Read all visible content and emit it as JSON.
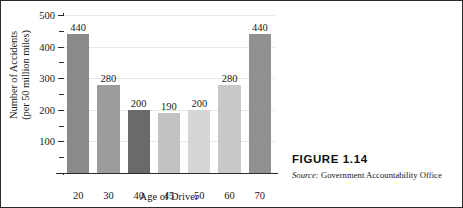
{
  "chart_data": {
    "type": "bar",
    "title": "",
    "xlabel": "Age of Driver",
    "ylabel": "Number of Accidents (per 50 million miles)",
    "ylabel_lines": [
      "Number of Accidents",
      "(per 50 million miles)"
    ],
    "categories": [
      "20",
      "30",
      "40",
      "45",
      "50",
      "60",
      "70"
    ],
    "values": [
      440,
      280,
      200,
      190,
      200,
      280,
      440
    ],
    "value_labels": [
      "440",
      "280",
      "200",
      "190",
      "200",
      "280",
      "440"
    ],
    "bar_colors": [
      "#8a8a8a",
      "#9c9c9c",
      "#6a6a6a",
      "#c2c2c2",
      "#d6d6d6",
      "#c9c9c9",
      "#919191"
    ],
    "ylim": [
      0,
      500
    ],
    "ytick_values": [
      100,
      200,
      300,
      400,
      500
    ],
    "ytick_labels": [
      "100",
      "200",
      "300",
      "400",
      "500"
    ],
    "yminor_values": [
      50,
      150,
      250,
      350,
      450
    ],
    "grid": "horizontal",
    "legend": "none"
  },
  "caption": {
    "figure_label": "FIGURE 1.14",
    "source_prefix": "Source:",
    "source_text": "Government Accountability Office"
  },
  "colors": {
    "axis": "#2b2b2b",
    "gridline": "#e8e8e8",
    "text": "#1a1a1a",
    "background": "#ffffff",
    "border": "#2b2b2b"
  }
}
